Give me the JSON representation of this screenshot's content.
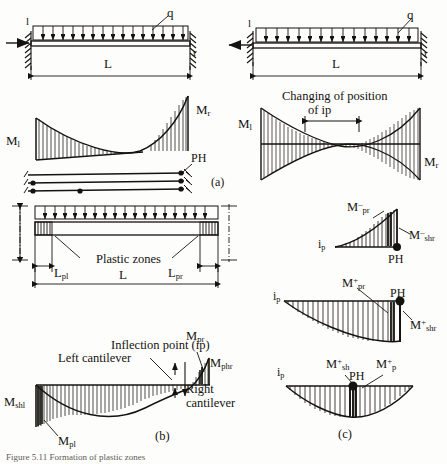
{
  "figure": {
    "caption": "Figure 5.11  Formation of plastic zones",
    "panel_labels": {
      "a": "(a)",
      "b": "(b)",
      "c": "(c)"
    }
  },
  "panel_a": {
    "beam": {
      "left_support_label": "l",
      "right_support_label": "r",
      "load_label": "q",
      "span_label": "L",
      "axial_arrow": "compression-arrow-right"
    },
    "moment": {
      "left": "M",
      "left_sub": "l",
      "right": "M",
      "right_sub": "r"
    },
    "mechanism": {
      "hinge_label": "PH"
    }
  },
  "panel_a_right": {
    "beam": {
      "left_support_label": "l",
      "right_support_label": "r",
      "load_label": "q",
      "span_label": "L",
      "axial_arrow": "tension-arrow-left"
    },
    "note_line1": "Changing of position",
    "note_line2": "of  ip",
    "moment": {
      "left": "M",
      "left_sub": "l",
      "right": "M",
      "right_sub": "r"
    }
  },
  "panel_b": {
    "beam": {
      "plastic_zones_label": "Plastic zones",
      "len_left": "L",
      "len_left_sub": "pl",
      "len_right": "L",
      "len_right_sub": "pr",
      "span_label": "L"
    },
    "moment": {
      "left_cantilever": "Left cantilever",
      "right_cantilever_line1": "Right",
      "right_cantilever_line2": "cantilever",
      "inflection_point": "Inflection point (ip)",
      "m_shl": "M",
      "m_shl_sub": "shl",
      "m_pl": "M",
      "m_pl_sub": "pl",
      "m_pr": "M",
      "m_pr_sub": "pr",
      "m_phr": "M",
      "m_phr_sub": "phr"
    }
  },
  "panel_c": {
    "diagram1": {
      "ip": "i",
      "ip_sub": "p",
      "m_pr": "M",
      "m_pr_sub": "pr",
      "m_pr_sup": "–",
      "m_shr": "M",
      "m_shr_sub": "shr",
      "m_shr_sup": "–",
      "ph": "PH"
    },
    "diagram2": {
      "ip": "i",
      "ip_sub": "p",
      "m_pr": "M",
      "m_pr_sub": "pr",
      "m_pr_sup": "+",
      "m_shr": "M",
      "m_shr_sub": "shr",
      "m_shr_sup": "+",
      "ph": "PH"
    },
    "diagram3": {
      "ip": "i",
      "ip_sub": "p",
      "m_sh": "M",
      "m_sh_sub": "sh",
      "m_sh_sup": "+",
      "m_p": "M",
      "m_p_sub": "p",
      "m_p_sup": "+",
      "ph": "PH"
    }
  },
  "colors": {
    "ink": "#14130f",
    "paper": "#fdfdfb",
    "caption": "#5e5c56"
  }
}
